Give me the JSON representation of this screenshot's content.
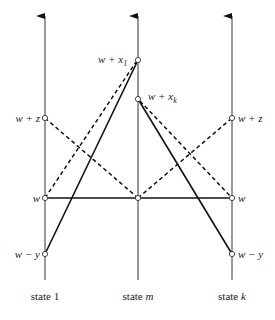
{
  "diagram": {
    "axes": [
      {
        "id": "state1",
        "label_prefix": "state ",
        "label_var": "1",
        "label_var_italic": false,
        "x": 45
      },
      {
        "id": "statem",
        "label_prefix": "state ",
        "label_var": "m",
        "label_var_italic": true,
        "x": 138
      },
      {
        "id": "statek",
        "label_prefix": "state ",
        "label_var": "k",
        "label_var_italic": true,
        "x": 232
      }
    ],
    "levels": {
      "w_plus_x1": {
        "text": "w + x",
        "sub": "1",
        "y": 60
      },
      "w_plus_xk": {
        "text": "w + x",
        "sub": "k",
        "y": 99
      },
      "w_plus_z": {
        "text": "w + z",
        "y": 118
      },
      "w": {
        "text": "w",
        "y": 198
      },
      "w_minus_y": {
        "text": "w − y",
        "y": 254
      }
    },
    "solid_lines": [
      {
        "from": "state1:w_minus_y",
        "to": "statem:w_plus_x1"
      },
      {
        "from": "statem:w_plus_xk",
        "to": "statek:w_minus_y"
      },
      {
        "from": "state1:w",
        "to": "statek:w"
      }
    ],
    "dashed_lines": [
      {
        "from": "state1:w",
        "to": "statem:w_plus_x1"
      },
      {
        "from": "state1:w_plus_z",
        "to": "statem:w"
      },
      {
        "from": "statem:w",
        "to": "statek:w_plus_z"
      },
      {
        "from": "statem:w_plus_xk",
        "to": "statek:w"
      }
    ]
  }
}
